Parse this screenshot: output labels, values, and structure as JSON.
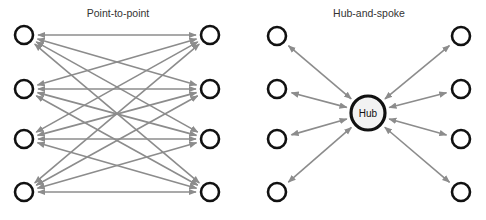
{
  "colors": {
    "node_stroke": "#111111",
    "edge": "#8c8c8c",
    "hub_fill": "#f2f2f2",
    "title": "#333333"
  },
  "diagrams": [
    {
      "id": "point-to-point",
      "title": "Point-to-point",
      "title_pos": [
        118,
        17
      ],
      "left_nodes": [
        [
          24,
          35
        ],
        [
          24,
          89
        ],
        [
          24,
          139
        ],
        [
          24,
          192
        ]
      ],
      "right_nodes": [
        [
          210,
          35
        ],
        [
          210,
          89
        ],
        [
          210,
          139
        ],
        [
          210,
          192
        ]
      ],
      "edges": "complete-bipartite",
      "edge_count": 16,
      "bidirectional": true
    },
    {
      "id": "hub-and-spoke",
      "title": "Hub-and-spoke",
      "title_pos": [
        369,
        17
      ],
      "hub": {
        "label": "Hub",
        "pos": [
          368,
          113
        ],
        "r": 17
      },
      "left_nodes": [
        [
          277,
          36
        ],
        [
          277,
          89
        ],
        [
          277,
          139
        ],
        [
          277,
          192
        ]
      ],
      "right_nodes": [
        [
          461,
          36
        ],
        [
          461,
          89
        ],
        [
          461,
          139
        ],
        [
          461,
          192
        ]
      ],
      "edges": "spokes-to-hub",
      "edge_count": 8,
      "bidirectional": true
    }
  ]
}
